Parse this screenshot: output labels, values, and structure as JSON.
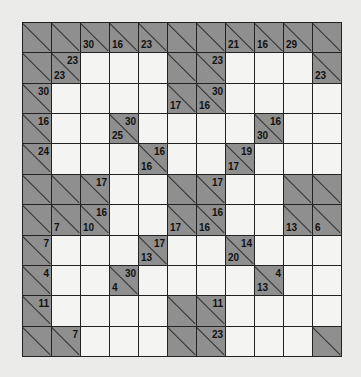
{
  "puzzle": {
    "type": "kakuro",
    "rows": 11,
    "cols": 11,
    "colors": {
      "block": "#8f8f8f",
      "white": "#f4f4f2",
      "line": "#222222"
    },
    "grid": [
      [
        {
          "b": 1
        },
        {
          "b": 1
        },
        {
          "b": 1,
          "d": "30"
        },
        {
          "b": 1,
          "d": "16"
        },
        {
          "b": 1,
          "d": "23"
        },
        {
          "b": 1
        },
        {
          "b": 1
        },
        {
          "b": 1,
          "d": "21"
        },
        {
          "b": 1,
          "d": "16"
        },
        {
          "b": 1,
          "d": "29"
        },
        {
          "b": 1
        }
      ],
      [
        {
          "b": 1
        },
        {
          "b": 1,
          "r": "23",
          "d": "23"
        },
        {},
        {},
        {},
        {
          "b": 1
        },
        {
          "b": 1,
          "r": "23"
        },
        {},
        {},
        {},
        {
          "b": 1,
          "d": "23"
        }
      ],
      [
        {
          "b": 1,
          "r": "30"
        },
        {},
        {},
        {},
        {},
        {
          "b": 1,
          "d": "17"
        },
        {
          "b": 1,
          "r": "30",
          "d": "16"
        },
        {},
        {},
        {},
        {}
      ],
      [
        {
          "b": 1,
          "r": "16"
        },
        {},
        {},
        {
          "b": 1,
          "r": "30",
          "d": "25"
        },
        {},
        {},
        {},
        {},
        {
          "b": 1,
          "r": "16",
          "d": "30"
        },
        {},
        {}
      ],
      [
        {
          "b": 1,
          "r": "24"
        },
        {},
        {},
        {},
        {
          "b": 1,
          "r": "16",
          "d": "16"
        },
        {},
        {},
        {
          "b": 1,
          "r": "19",
          "d": "17"
        },
        {},
        {},
        {}
      ],
      [
        {
          "b": 1
        },
        {
          "b": 1
        },
        {
          "b": 1,
          "r": "17"
        },
        {},
        {},
        {
          "b": 1
        },
        {
          "b": 1,
          "r": "17"
        },
        {},
        {},
        {
          "b": 1
        },
        {
          "b": 1
        }
      ],
      [
        {
          "b": 1
        },
        {
          "b": 1,
          "d": "7"
        },
        {
          "b": 1,
          "r": "16",
          "d": "10"
        },
        {},
        {},
        {
          "b": 1,
          "d": "17"
        },
        {
          "b": 1,
          "r": "16",
          "d": "16"
        },
        {},
        {},
        {
          "b": 1,
          "d": "13"
        },
        {
          "b": 1,
          "d": "6"
        }
      ],
      [
        {
          "b": 1,
          "r": "7"
        },
        {},
        {},
        {},
        {
          "b": 1,
          "r": "17",
          "d": "13"
        },
        {},
        {},
        {
          "b": 1,
          "r": "14",
          "d": "20"
        },
        {},
        {},
        {}
      ],
      [
        {
          "b": 1,
          "r": "4"
        },
        {},
        {},
        {
          "b": 1,
          "r": "30",
          "d": "4"
        },
        {},
        {},
        {},
        {},
        {
          "b": 1,
          "r": "4",
          "d": "13"
        },
        {},
        {}
      ],
      [
        {
          "b": 1,
          "r": "11"
        },
        {},
        {},
        {},
        {},
        {
          "b": 1
        },
        {
          "b": 1,
          "r": "11"
        },
        {},
        {},
        {},
        {}
      ],
      [
        {
          "b": 1
        },
        {
          "b": 1,
          "r": "7"
        },
        {},
        {},
        {},
        {
          "b": 1
        },
        {
          "b": 1,
          "r": "23"
        },
        {},
        {},
        {},
        {
          "b": 1
        }
      ]
    ]
  }
}
